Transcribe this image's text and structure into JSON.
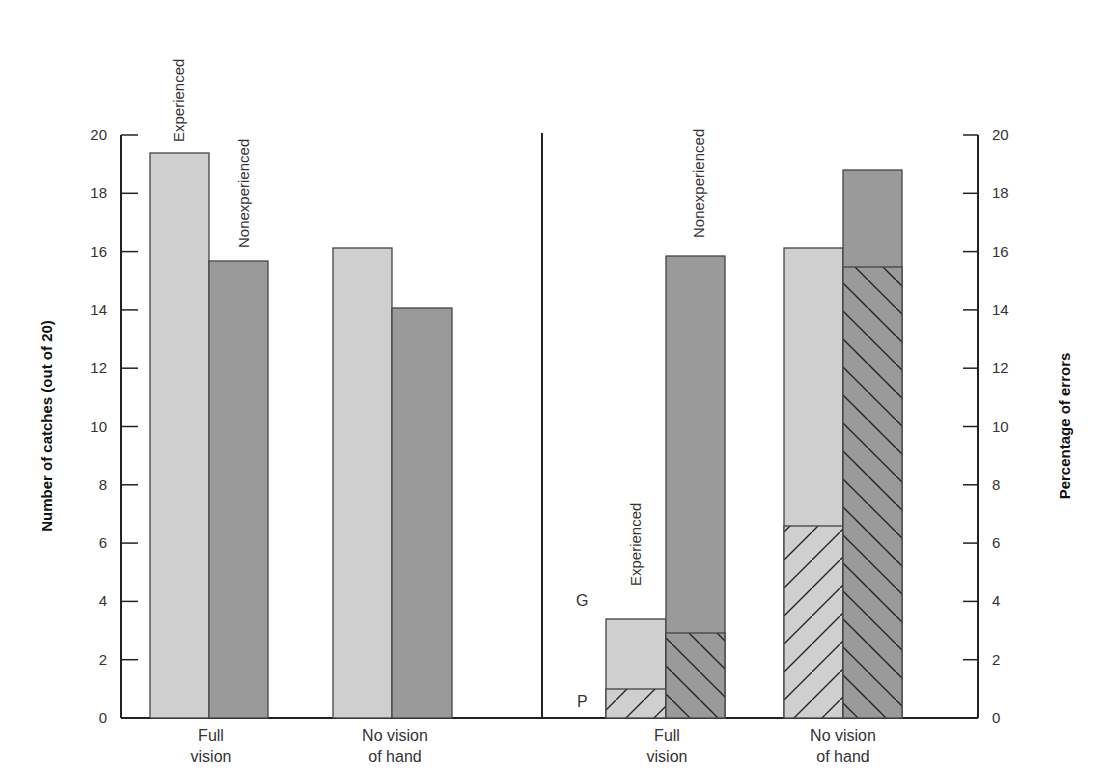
{
  "chart_data": [
    {
      "type": "bar",
      "title": "",
      "xlabel": "",
      "ylabel": "Number of catches (out of 20)",
      "ylim": [
        0,
        20
      ],
      "yticks": [
        0,
        2,
        4,
        6,
        8,
        10,
        12,
        14,
        16,
        18,
        20
      ],
      "categories": [
        "Full vision",
        "No vision of hand"
      ],
      "series": [
        {
          "name": "Experienced",
          "values": [
            19.4,
            16.0
          ],
          "color": "#cfcfcf"
        },
        {
          "name": "Nonexperienced",
          "values": [
            15.5,
            13.8
          ],
          "color": "#9a9a9a"
        }
      ],
      "annotations": [
        "Experienced",
        "Nonexperienced"
      ],
      "grid": false
    },
    {
      "type": "bar",
      "stacked": true,
      "title": "",
      "xlabel": "",
      "ylabel": "Percentage of errors",
      "ylim": [
        0,
        20
      ],
      "yticks": [
        0,
        2,
        4,
        6,
        8,
        10,
        12,
        14,
        16,
        18,
        20
      ],
      "categories": [
        "Full vision",
        "No vision of hand"
      ],
      "series": [
        {
          "name": "Experienced - P (hatched)",
          "values": [
            1.0,
            6.6
          ]
        },
        {
          "name": "Experienced - G (total)",
          "values": [
            3.4,
            16.0
          ]
        },
        {
          "name": "Nonexperienced - P (hatched)",
          "values": [
            2.9,
            15.3
          ]
        },
        {
          "name": "Nonexperienced - G (total)",
          "values": [
            15.7,
            18.8
          ]
        }
      ],
      "annotations": [
        "Experienced",
        "Nonexperienced",
        "G",
        "P"
      ],
      "grid": false
    }
  ],
  "labels": {
    "left_ylabel": "Number of catches (out of 20)",
    "right_ylabel": "Percentage of errors",
    "experienced": "Experienced",
    "nonexperienced": "Nonexperienced",
    "g": "G",
    "p": "P",
    "cat1_line1": "Full",
    "cat1_line2": "vision",
    "cat2_line1": "No vision",
    "cat2_line2": "of hand"
  },
  "ticks": [
    "0",
    "2",
    "4",
    "6",
    "8",
    "10",
    "12",
    "14",
    "16",
    "18",
    "20"
  ]
}
